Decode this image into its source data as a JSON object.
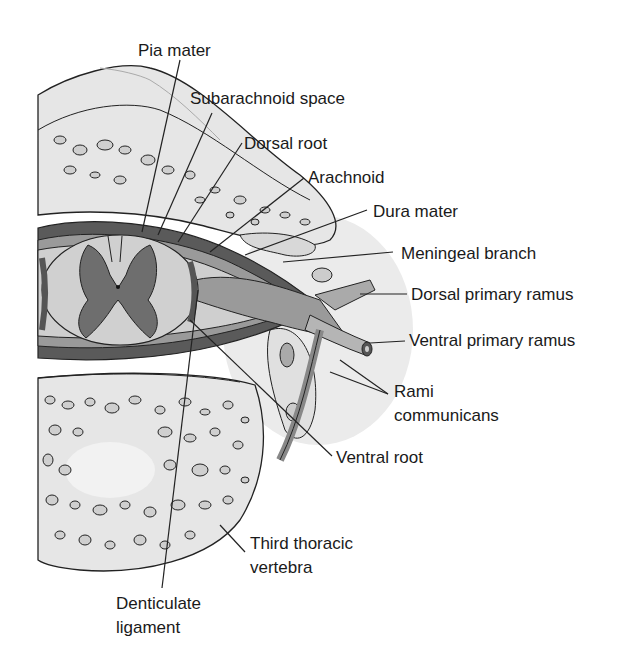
{
  "diagram": {
    "labels": {
      "pia_mater": "Pia mater",
      "subarachnoid_space": "Subarachnoid space",
      "dorsal_root": "Dorsal root",
      "arachnoid": "Arachnoid",
      "dura_mater": "Dura mater",
      "meningeal_branch": "Meningeal branch",
      "dorsal_primary_ramus": "Dorsal primary ramus",
      "ventral_primary_ramus": "Ventral primary ramus",
      "rami_communicans_1": "Rami",
      "rami_communicans_2": "communicans",
      "ventral_root": "Ventral root",
      "third_thoracic_vertebra_1": "Third thoracic",
      "third_thoracic_vertebra_2": "vertebra",
      "denticulate_ligament_1": "Denticulate",
      "denticulate_ligament_2": "ligament"
    },
    "colors": {
      "bone": "#e6e6e6",
      "outline": "#222222",
      "dura": "#5a5a5a",
      "gray_matter": "#6e6e6e",
      "white_matter": "#d0d0d0",
      "nerve": "#9a9a9a",
      "soft_tissue": "#ececec"
    }
  }
}
